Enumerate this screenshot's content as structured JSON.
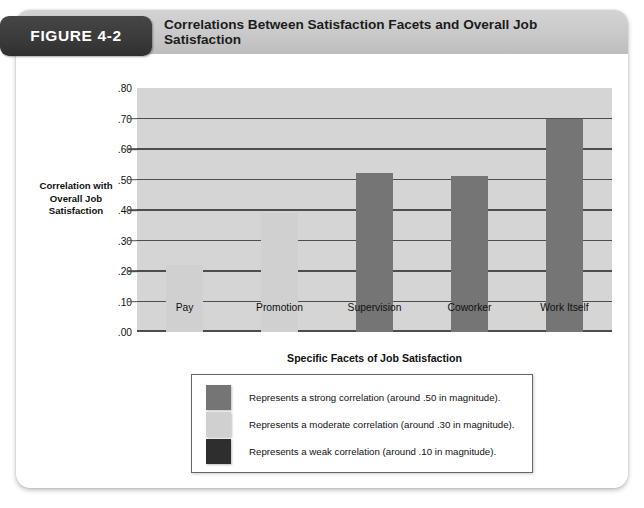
{
  "figure": {
    "badge_label": "FIGURE 4-2",
    "title": "Correlations Between Satisfaction Facets and Overall Job Satisfaction"
  },
  "colors": {
    "strong_bar": "#757575",
    "moderate_bar": "#d0d0d0",
    "weak_bar": "#2e2e2e",
    "plot_background": "#d5d5d5",
    "gridline": "#4d4d4d",
    "badge_background": "#3a3a3a",
    "header_background": "#c9c9c9"
  },
  "chart_data": {
    "type": "bar",
    "title": "Correlations Between Satisfaction Facets and Overall Job Satisfaction",
    "xlabel": "Specific Facets of Job Satisfaction",
    "ylabel": "Correlation with Overall Job Satisfaction",
    "categories": [
      "Pay",
      "Promotion",
      "Supervision",
      "Coworker",
      "Work Itself"
    ],
    "values": [
      0.22,
      0.39,
      0.52,
      0.51,
      0.7
    ],
    "bar_colors": [
      "#d0d0d0",
      "#d0d0d0",
      "#757575",
      "#757575",
      "#757575"
    ],
    "bar_strength": [
      "moderate",
      "moderate",
      "strong",
      "strong",
      "strong"
    ],
    "ylim": [
      0.0,
      0.8
    ],
    "ytick_labels": [
      ".80",
      ".70",
      ".60",
      ".50",
      ".40",
      ".30",
      ".20",
      ".10",
      ".00"
    ],
    "ytick_values": [
      0.8,
      0.7,
      0.6,
      0.5,
      0.4,
      0.3,
      0.2,
      0.1,
      0.0
    ],
    "grid": true,
    "legend_position": "below-plot"
  },
  "axis": {
    "y_title_lines": [
      "Correlation with",
      "Overall Job",
      "Satisfaction"
    ],
    "x_title": "Specific Facets of Job Satisfaction"
  },
  "legend": {
    "entries": [
      {
        "color": "#757575",
        "label": "Represents a strong correlation (around .50 in magnitude)."
      },
      {
        "color": "#d0d0d0",
        "label": "Represents a moderate correlation (around .30 in magnitude)."
      },
      {
        "color": "#2e2e2e",
        "label": "Represents a weak correlation (around .10 in magnitude)."
      }
    ]
  }
}
